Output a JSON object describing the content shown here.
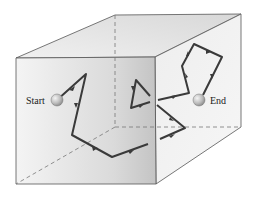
{
  "diagram": {
    "type": "random-walk-in-box",
    "labels": {
      "start": "Start",
      "end": "End"
    },
    "colors": {
      "path": "#3a3a3a",
      "edge": "#555555",
      "hidden_edge": "#777777",
      "front_face_light": "#f2f2f2",
      "front_face_dark": "#c4c4c4",
      "top_face": "#e6e6e6",
      "right_face": "#ececec",
      "ball": "#bdbdbd"
    },
    "box": {
      "front": [
        [
          16,
          58
        ],
        [
          155,
          57
        ],
        [
          156,
          184
        ],
        [
          16,
          184
        ]
      ],
      "back": [
        [
          115,
          15
        ],
        [
          241,
          14
        ],
        [
          241,
          127
        ],
        [
          115,
          127
        ]
      ]
    },
    "start_point": [
      57,
      100
    ],
    "end_point": [
      199,
      100
    ],
    "path_segments": [
      [
        [
          57,
          100
        ],
        [
          86,
          74
        ],
        [
          72,
          135
        ],
        [
          112,
          157
        ],
        [
          148,
          144
        ]
      ],
      [
        [
          150,
          96
        ],
        [
          136,
          80
        ],
        [
          131,
          108
        ],
        [
          150,
          102
        ]
      ],
      [
        [
          157,
          105
        ],
        [
          185,
          128
        ],
        [
          160,
          139
        ]
      ],
      [
        [
          158,
          100
        ],
        [
          189,
          93
        ],
        [
          182,
          66
        ],
        [
          194,
          44
        ],
        [
          222,
          57
        ],
        [
          203,
          95
        ]
      ]
    ]
  }
}
